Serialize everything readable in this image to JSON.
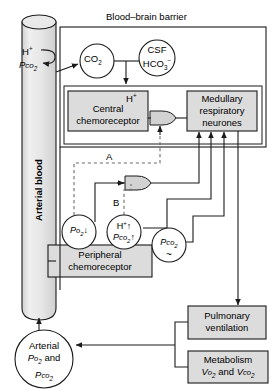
{
  "diagram": {
    "barrier_label": "Blood–brain barrier",
    "vessel_label": "Arterial blood",
    "vessel_inputs": {
      "h_plus": "H+",
      "pco2": "Pco2"
    },
    "nodes": {
      "co2": "CO2",
      "csf": {
        "line1": "CSF",
        "line2": "HCO3-"
      },
      "central_chemoreceptor": {
        "marker": "H+",
        "line1": "Central",
        "line2": "chemoreceptor"
      },
      "medullary": {
        "line1": "Medullary",
        "line2": "respiratory",
        "line3": "neurones"
      },
      "po2_drop": "Po2",
      "po2_arrow": "down",
      "h_pco2": {
        "line1": "H+",
        "line1_arrow": "up",
        "line2": "Pco2",
        "line2_arrow": "up"
      },
      "peripheral_chemoreceptor": {
        "line1": "Peripheral",
        "line2": "chemoreceptor"
      },
      "pco2_tilde": {
        "line1": "Pco2",
        "line2": "~"
      },
      "arterial_gases": {
        "line1": "Arterial",
        "line2": "Po2 and",
        "line3": "Pco2"
      },
      "pulmonary_ventilation": {
        "line1": "Pulmonary",
        "line2": "ventilation"
      },
      "metabolism": {
        "line1": "Metabolism",
        "line2": "Vo2 and Vco2"
      }
    },
    "path_labels": {
      "a": "A",
      "b": "B"
    },
    "colors": {
      "stroke": "#1a1a1a",
      "box_fill": "#dcdcdc",
      "vessel_fill": "#e4e4e4",
      "gate_fill": "#d2d2d2",
      "circle_fill": "#ffffff",
      "dashed": "#6e6e6e",
      "background": "#ffffff"
    }
  }
}
